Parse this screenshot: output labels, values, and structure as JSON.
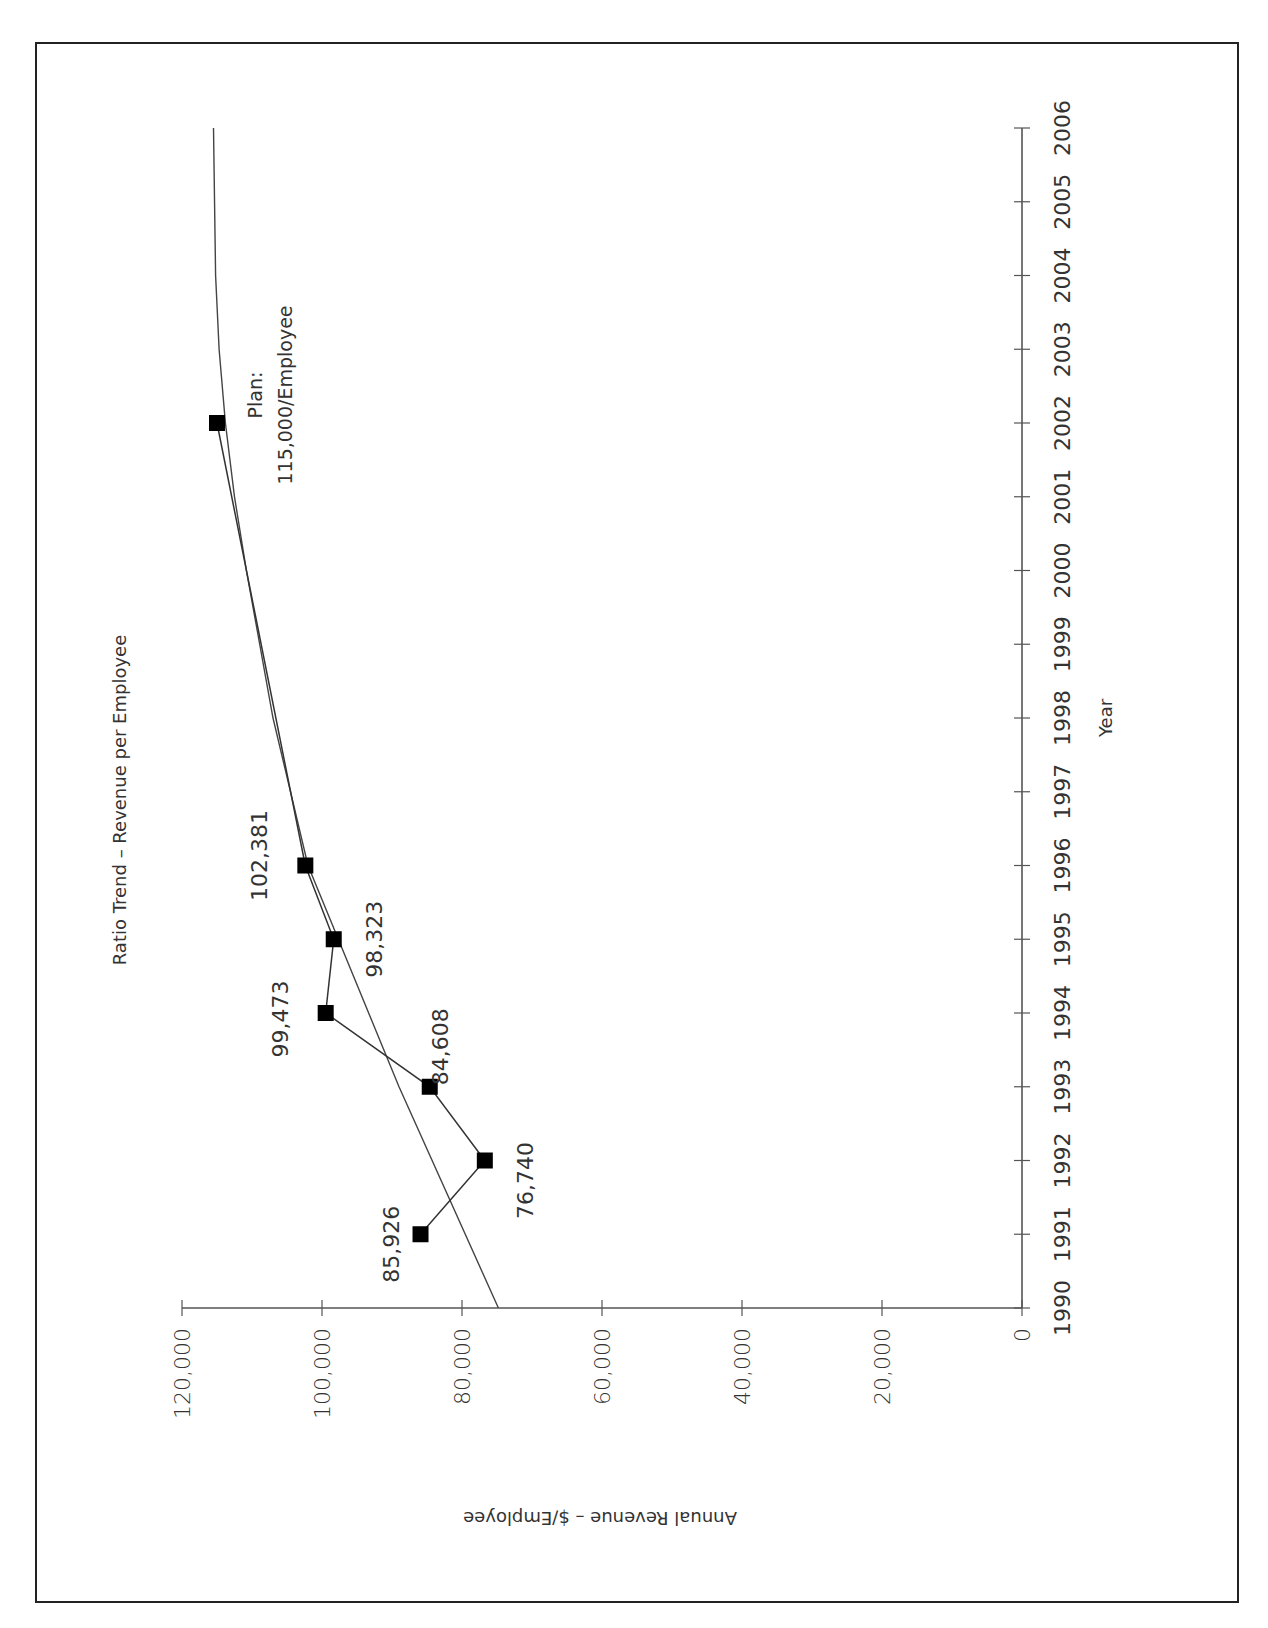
{
  "chart_data": {
    "type": "line",
    "title": "Ratio Trend – Revenue per Employee",
    "xlabel": "Year",
    "ylabel": "Annual Revenue – $/Employee",
    "orientation": "rotated 90° clockwise",
    "x_ticks": [
      "1990",
      "1991",
      "1992",
      "1993",
      "1994",
      "1995",
      "1996",
      "1997",
      "1998",
      "1999",
      "2000",
      "2001",
      "2002",
      "2003",
      "2004",
      "2005",
      "2006"
    ],
    "y_ticks": [
      "0",
      "20,000",
      "40,000",
      "60,000",
      "80,000",
      "100,000",
      "120,000"
    ],
    "xlim": [
      1990,
      2006
    ],
    "ylim": [
      0,
      120000
    ],
    "grid": false,
    "legend": null,
    "series": [
      {
        "name": "Actual / Plan",
        "marker": "square",
        "points": [
          {
            "x": 1991,
            "y": 85926,
            "label": "85,926"
          },
          {
            "x": 1992,
            "y": 76740,
            "label": "76,740"
          },
          {
            "x": 1993,
            "y": 84608,
            "label": "84,608"
          },
          {
            "x": 1994,
            "y": 99473,
            "label": "99,473"
          },
          {
            "x": 1995,
            "y": 98323,
            "label": "98,323"
          },
          {
            "x": 1996,
            "y": 102381,
            "label": "102,381"
          },
          {
            "x": 2002,
            "y": 115000,
            "label": "Plan:|115,000/Employee"
          }
        ]
      },
      {
        "name": "Trend",
        "marker": "none",
        "points": [
          {
            "x": 1990,
            "y": 74800
          },
          {
            "x": 1993,
            "y": 89000
          },
          {
            "x": 1996,
            "y": 102000
          },
          {
            "x": 1998,
            "y": 107000
          },
          {
            "x": 2000,
            "y": 110800
          },
          {
            "x": 2001,
            "y": 112500
          },
          {
            "x": 2002,
            "y": 113800
          },
          {
            "x": 2003,
            "y": 114700
          },
          {
            "x": 2004,
            "y": 115200
          },
          {
            "x": 2006,
            "y": 115500
          }
        ]
      }
    ],
    "annotations": [
      {
        "text_line1": "Plan:",
        "text_line2": "115,000/Employee",
        "x": 2002
      }
    ]
  }
}
